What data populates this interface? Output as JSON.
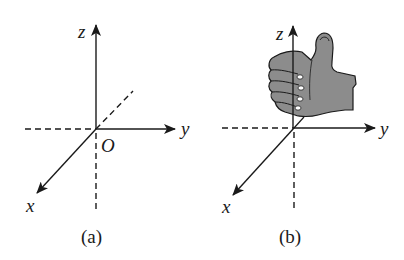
{
  "figure": {
    "panels": [
      {
        "id": "a",
        "caption": "(a)",
        "axes": {
          "z": "z",
          "y": "y",
          "x": "x"
        },
        "origin_label": "O",
        "hand": false
      },
      {
        "id": "b",
        "caption": "(b)",
        "axes": {
          "z": "z",
          "y": "y",
          "x": "x"
        },
        "hand": true,
        "hand_description": "right-hand thumbs-up, thumb along z axis"
      }
    ],
    "colors": {
      "ink": "#1a1a1a",
      "hand_fill": "#8c8c8c",
      "background": "#ffffff"
    }
  }
}
